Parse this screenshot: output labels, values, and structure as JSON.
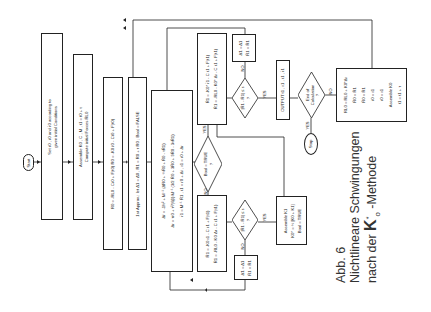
{
  "caption": {
    "line1": "Abb. 6",
    "line2": "Nichtlineare Schwingungen",
    "line3_prefix": "nach der ",
    "line3_symbol": "K",
    "line3_sup": "*",
    "line3_sub": "o",
    "line3_suffix": " -Methode"
  },
  "nodes": {
    "start": "Start",
    "set_initial": [
      "Set r0 , ṙ0 and r̈0 according to",
      "given initial Conditions"
    ],
    "assemble": [
      "Assemble K0 , C , M , t1 = t0 + τ",
      "Compute initial Forces R̄L0"
    ],
    "residual0": [
      "R0 = -RL0 - Cṙ0 + F(t0)      R̄0 = -K0 r̄0 - Cr̄0 + F(t0)"
    ],
    "first_approx": [
      "1st Approx.: let Δ̄1 = Δ̄0 , R̄1 = R̄0 + τ R̄0 ; Bool = FALSE"
    ],
    "big_eqs": [
      "Δ̇ṙ = -1/τ² + M⁻¹ (Δ̄R0 + ½R̄0 + R̄0 - τR̄1)",
      "Δr = τṙ0 + τ²/(6β) M⁻¹ (3/2 R̄0 + 3R̄0 + 9R̄0 - 3τR̄1)",
      "r̈1 = M⁻¹ R̄1 ,  ṙ1 = ṙ0 + Δṙ ,  r1 = r0 + Δr"
    ],
    "bool_true": [
      "Bool = TRUE",
      "?"
    ],
    "upper_box": [
      "R̄1 = -K0* r̄1 - C ṙ1 + F(t1)",
      "R̄1 = -RL0 - K0* Δr - C ṙ1 + F(t1)"
    ],
    "lower_box": [
      "R̄1 = -K0 r1 - C ṙ1 + F(t1)",
      "R̄1 = -RL0 - K0 Δr - C ṙ1 + F(t1)"
    ],
    "check_upper": [
      "|R̄1 - R̄1| ≤ ε",
      "?"
    ],
    "check_lower": [
      "|R̄1 - R̄1| ≤ ε",
      "?"
    ],
    "update_upper": [
      "Δ̄1 = Δ̄1",
      "R̄1 = R̄1"
    ],
    "update_lower": [
      "Δ̄1 = Δ̄1",
      "R̄1 = R̄1"
    ],
    "assemble_k1": [
      "Assemble K1",
      "K0* = ½ [K0 + K1]",
      "Bool = TRUE"
    ],
    "output": [
      "OUTPUT  t1 , r1 , ṙ1 , r̈1"
    ],
    "end_calc": [
      "End of",
      "Calculation",
      "?"
    ],
    "stop": "Stop",
    "final_update": [
      "RL0 = RL0 + K0*Δr",
      "R̄0 = R̄1",
      "R̄0 = R̄1",
      "ṙ0 = ṙ1",
      "r0 = r1",
      "Assemble K0",
      "t1 = t1 + τ"
    ]
  },
  "edge_labels": {
    "yes": "YES",
    "no": "NO"
  },
  "colors": {
    "line": "#222222",
    "text": "#1a1a1a",
    "caption": "#333333",
    "background": "#ffffff"
  }
}
